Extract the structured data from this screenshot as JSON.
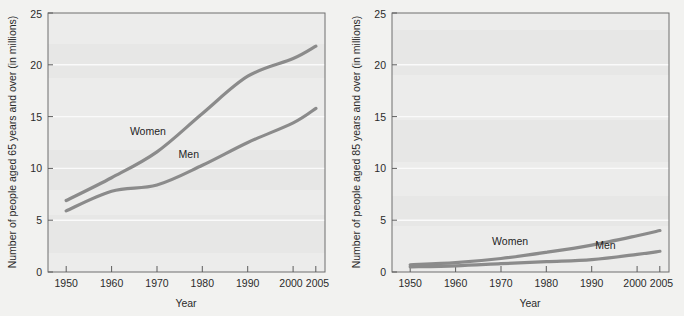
{
  "figure": {
    "panel_count": 2,
    "background_color": "#f2f2f0",
    "plot_background_color": "#ececeb",
    "line_color": "#8b8b8b",
    "gridline_color": "#fafafa",
    "frame_color": "#6f6f6f"
  },
  "chart_data": [
    {
      "type": "line",
      "title": "",
      "xlabel": "Year",
      "ylabel": "Number of people aged 65 years and over (in millions)",
      "xlim": [
        1946,
        2007
      ],
      "ylim": [
        0,
        25
      ],
      "xticks": [
        1950,
        1960,
        1970,
        1980,
        1990,
        2000,
        2005
      ],
      "xticklabels": [
        "1950",
        "1960",
        "1970",
        "1980",
        "1990",
        "2000",
        "2005"
      ],
      "yticks": [
        0,
        5,
        10,
        15,
        20,
        25
      ],
      "yticklabels": [
        "0",
        "5",
        "10",
        "15",
        "20",
        "25"
      ],
      "grid": true,
      "legend": "inline-annotations",
      "x": [
        1950,
        1960,
        1970,
        1980,
        1990,
        2000,
        2005
      ],
      "series": [
        {
          "name": "Women",
          "label": "Women",
          "label_x": 1968,
          "label_y": 13.2,
          "values": [
            6.9,
            9.1,
            11.6,
            15.3,
            18.9,
            20.6,
            21.8
          ]
        },
        {
          "name": "Men",
          "label": "Men",
          "label_x": 1977,
          "label_y": 11.0,
          "values": [
            5.9,
            7.8,
            8.4,
            10.3,
            12.5,
            14.4,
            15.8
          ]
        }
      ]
    },
    {
      "type": "line",
      "title": "",
      "xlabel": "Year",
      "ylabel": "Number of people aged 85 years and over (in millions)",
      "xlim": [
        1946,
        2007
      ],
      "ylim": [
        0,
        25
      ],
      "xticks": [
        1950,
        1960,
        1970,
        1980,
        1990,
        2000,
        2005
      ],
      "xticklabels": [
        "1950",
        "1960",
        "1970",
        "1980",
        "1990",
        "2000",
        "2005"
      ],
      "yticks": [
        0,
        5,
        10,
        15,
        20,
        25
      ],
      "yticklabels": [
        "0",
        "5",
        "10",
        "15",
        "20",
        "25"
      ],
      "grid": true,
      "legend": "inline-annotations",
      "x": [
        1950,
        1960,
        1970,
        1980,
        1990,
        2000,
        2005
      ],
      "series": [
        {
          "name": "Women",
          "label": "Women",
          "label_x": 1972,
          "label_y": 2.6,
          "values": [
            0.7,
            0.9,
            1.3,
            1.9,
            2.6,
            3.5,
            4.0
          ]
        },
        {
          "name": "Men",
          "label": "Men",
          "label_x": 1993,
          "label_y": 2.2,
          "values": [
            0.5,
            0.6,
            0.8,
            1.0,
            1.2,
            1.7,
            2.0
          ]
        }
      ]
    }
  ]
}
